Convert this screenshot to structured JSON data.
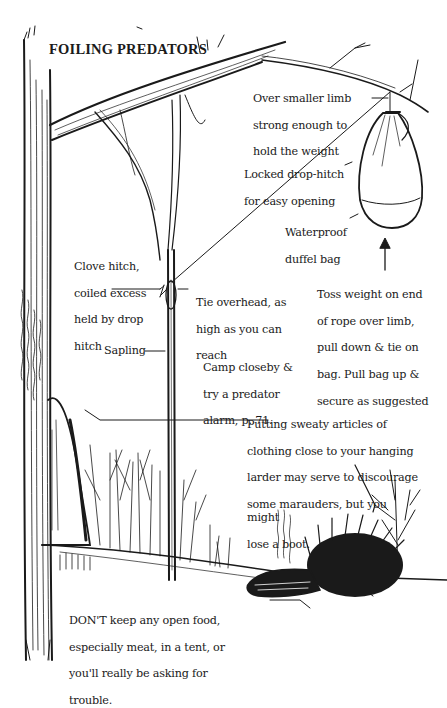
{
  "title": "FOILING PREDATORS",
  "labels": {
    "smaller_limb": [
      "Over smaller limb",
      "strong enough to",
      "hold the weight"
    ],
    "drop_hitch": [
      "Locked drop-hitch",
      "for easy opening"
    ],
    "duffel": [
      "Waterproof",
      "duffel bag"
    ],
    "clove_hitch": [
      "Clove hitch,",
      "coiled excess",
      "held by drop",
      "hitch"
    ],
    "tie_overhead": [
      "Tie overhead, as",
      "high as you can",
      "reach"
    ],
    "toss_weight": [
      "Toss weight on end",
      "of rope over limb,",
      "pull down & tie on",
      "bag. Pull bag up &",
      "secure as suggested"
    ],
    "sapling": "Sapling",
    "camp_closeby": [
      "Camp closeby &",
      "try a predator",
      "alarm, p. 71."
    ],
    "sweaty_articles": [
      "Putting sweaty articles of",
      "clothing close to your hanging",
      "larder may serve to discourage",
      "some marauders, but you might",
      "lose a boot."
    ],
    "dont_keep": [
      "DON'T keep any open food,",
      "especially meat, in a tent, or",
      "you'll really be asking for",
      "trouble."
    ]
  },
  "illustration": {
    "elements": [
      "large-tree-trunk",
      "overhanging-limb",
      "smaller-limb",
      "hanging-duffel-bag",
      "sapling",
      "rope",
      "tent",
      "bare-shrubs",
      "porcupine",
      "boot"
    ],
    "ink_color": "#1a1a1a",
    "paper_color": "#ffffff"
  }
}
